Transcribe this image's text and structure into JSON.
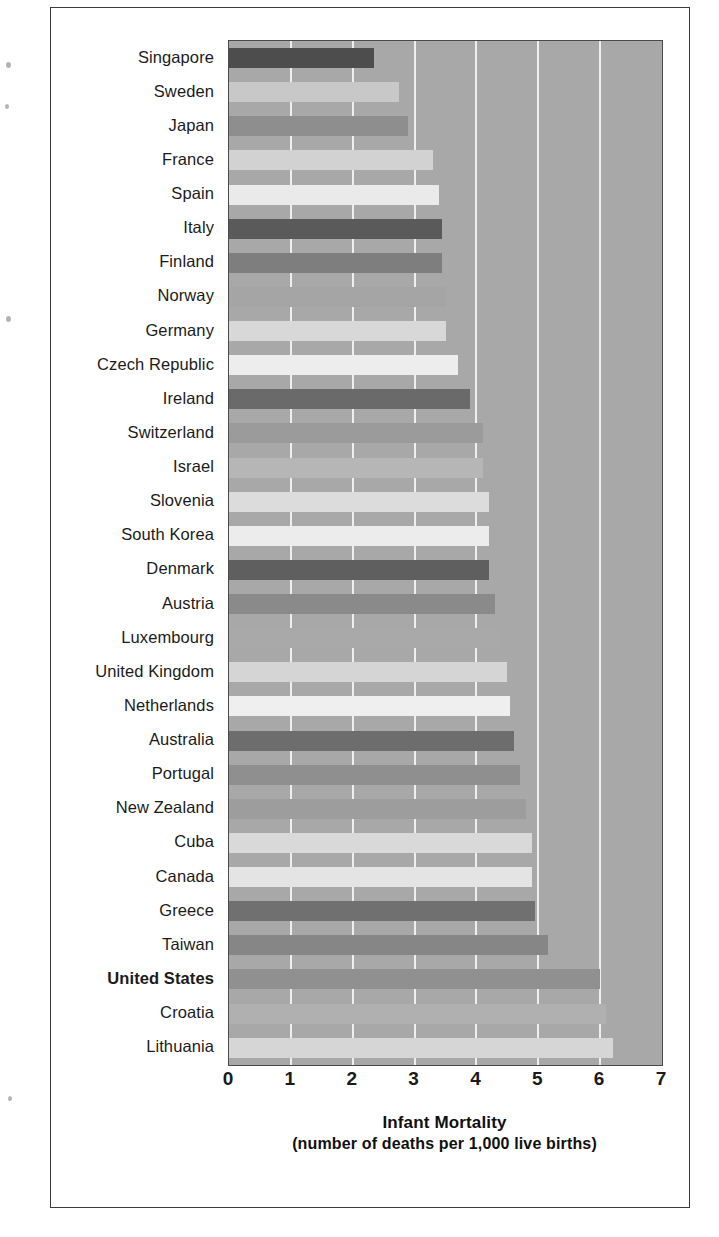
{
  "chart_data": {
    "type": "bar",
    "orientation": "horizontal",
    "title": "",
    "xlabel": "Infant Mortality",
    "xlabel_sub": "(number of deaths per 1,000 live births)",
    "ylabel": "",
    "xlim": [
      0,
      7
    ],
    "xticks": [
      "0",
      "1",
      "2",
      "3",
      "4",
      "5",
      "6",
      "7"
    ],
    "grid": true,
    "legend": "none",
    "highlight_category": "United States",
    "plot_background": "#a8a8a8",
    "gridline_color": "#f2f2f2",
    "categories": [
      "Singapore",
      "Sweden",
      "Japan",
      "France",
      "Spain",
      "Italy",
      "Finland",
      "Norway",
      "Germany",
      "Czech Republic",
      "Ireland",
      "Switzerland",
      "Israel",
      "Slovenia",
      "South Korea",
      "Denmark",
      "Austria",
      "Luxembourg",
      "United Kingdom",
      "Netherlands",
      "Australia",
      "Portugal",
      "New Zealand",
      "Cuba",
      "Canada",
      "Greece",
      "Taiwan",
      "United States",
      "Croatia",
      "Lithuania"
    ],
    "values": [
      2.35,
      2.75,
      2.9,
      3.3,
      3.4,
      3.45,
      3.45,
      3.5,
      3.5,
      3.7,
      3.9,
      4.1,
      4.1,
      4.2,
      4.2,
      4.2,
      4.3,
      4.4,
      4.5,
      4.55,
      4.6,
      4.7,
      4.8,
      4.9,
      4.9,
      4.95,
      5.15,
      6.0,
      6.1,
      6.2
    ],
    "bar_colors": [
      "#4d4d4d",
      "#c8c8c8",
      "#8e8e8e",
      "#d2d2d2",
      "#eaeaea",
      "#5a5a5a",
      "#7e7e7e",
      "#a5a5a5",
      "#d8d8d8",
      "#ededed",
      "#6a6a6a",
      "#9b9b9b",
      "#b6b6b6",
      "#dcdcdc",
      "#ececec",
      "#5f5f5f",
      "#8a8a8a",
      "#a9a9a9",
      "#d5d5d5",
      "#efefef",
      "#6d6d6d",
      "#8f8f8f",
      "#9d9d9d",
      "#d9d9d9",
      "#e4e4e4",
      "#707070",
      "#868686",
      "#909090",
      "#b0b0b0",
      "#d6d6d6"
    ]
  },
  "axis": {
    "label_main": "Infant Mortality",
    "label_sub": "(number of deaths per 1,000 live births)"
  }
}
